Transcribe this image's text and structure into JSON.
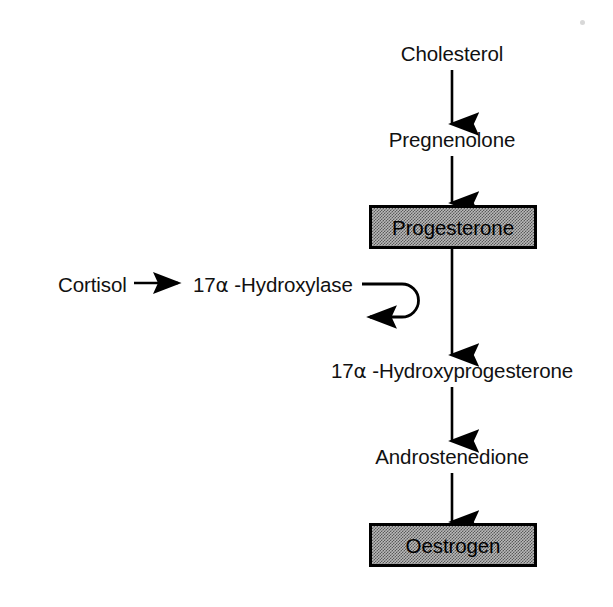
{
  "diagram": {
    "type": "flowchart",
    "colors": {
      "stroke": "#000000",
      "box_fill": "#b9b9b9",
      "box_fill_dither": "#5a5a5a",
      "text": "#111111",
      "background": "#ffffff"
    },
    "nodes": [
      {
        "id": "cholesterol",
        "label": "Cholesterol",
        "shape": "plain-text",
        "x": 452,
        "y": 55
      },
      {
        "id": "pregnenolone",
        "label": "Pregnenolone",
        "shape": "plain-text",
        "x": 452,
        "y": 141
      },
      {
        "id": "progesterone",
        "label": "Progesterone",
        "shape": "filled-box",
        "x": 452,
        "y": 227
      },
      {
        "id": "hydroxyprogesterone",
        "label_pre": "17",
        "label_alpha": "α",
        "label_post": " -Hydroxyprogesterone",
        "label": "17α -Hydroxyprogesterone",
        "shape": "plain-text",
        "x": 452,
        "y": 372
      },
      {
        "id": "androstenedione",
        "label": "Androstenedione",
        "shape": "plain-text",
        "x": 452,
        "y": 458
      },
      {
        "id": "oestrogen",
        "label": "Oestrogen",
        "shape": "filled-box",
        "x": 452,
        "y": 545
      },
      {
        "id": "cortisol",
        "label": "Cortisol",
        "shape": "plain-text",
        "x": 58,
        "y": 287
      },
      {
        "id": "hydroxylase",
        "label_pre": "17",
        "label_alpha": "α",
        "label_post": " -Hydroxylase",
        "label": "17α -Hydroxylase",
        "shape": "plain-text",
        "x": 193,
        "y": 287
      }
    ],
    "edges": [
      {
        "id": "edge-cholesterol-pregnenolone",
        "from": "cholesterol",
        "to": "pregnenolone",
        "kind": "arrow-down"
      },
      {
        "id": "edge-pregnenolone-progesterone",
        "from": "pregnenolone",
        "to": "progesterone",
        "kind": "arrow-down"
      },
      {
        "id": "edge-progesterone-hydroxyprogesterone",
        "from": "progesterone",
        "to": "hydroxyprogesterone",
        "kind": "arrow-down"
      },
      {
        "id": "edge-hydroxyprogesterone-androstenedione",
        "from": "hydroxyprogesterone",
        "to": "androstenedione",
        "kind": "arrow-down"
      },
      {
        "id": "edge-androstenedione-oestrogen",
        "from": "androstenedione",
        "to": "oestrogen",
        "kind": "arrow-down"
      },
      {
        "id": "edge-cortisol-hydroxylase",
        "from": "cortisol",
        "to": "hydroxylase",
        "kind": "arrow-right"
      },
      {
        "id": "edge-hydroxylase-hook",
        "from": "hydroxylase",
        "to": "pathway",
        "kind": "u-turn-hook-arrow-left"
      }
    ]
  }
}
